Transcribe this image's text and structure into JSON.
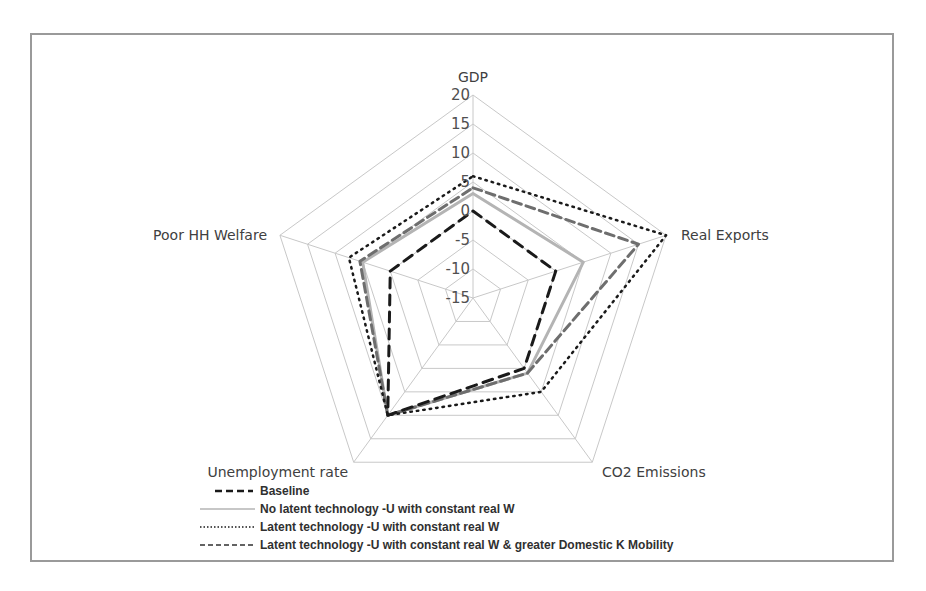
{
  "chart_data": {
    "type": "radar",
    "title": "",
    "categories": [
      "GDP",
      "Real Exports",
      "CO2 Emissions",
      "Unemployment rate",
      "Poor HH Welfare"
    ],
    "radial_ticks": [
      "-15",
      "-10",
      "-5",
      "0",
      "5",
      "10",
      "15",
      "20"
    ],
    "rlim": [
      -15,
      20
    ],
    "grid": true,
    "legend_position": "bottom",
    "series": [
      {
        "name": "Baseline",
        "style": "dashed-black",
        "values": [
          0,
          0,
          0,
          10,
          0
        ]
      },
      {
        "name": "No latent technology -U with constant real W",
        "style": "solid-lightgray",
        "values": [
          3,
          5,
          1,
          10,
          5
        ]
      },
      {
        "name": "Latent technology -U with constant real W",
        "style": "dotted-black",
        "values": [
          6,
          20,
          5,
          10,
          7.5
        ]
      },
      {
        "name": "Latent technology -U with constant real W & greater Domestic K Mobility",
        "style": "dashed-gray",
        "values": [
          4,
          15,
          1,
          10,
          5.5
        ]
      }
    ]
  },
  "colors": {
    "grid": "#c8c8c8",
    "baseline": "#1a1a1a",
    "no_latent": "#b4b4b4",
    "latent": "#1a1a1a",
    "latent_k": "#6e6e6e",
    "border": "#9a9a9a"
  }
}
